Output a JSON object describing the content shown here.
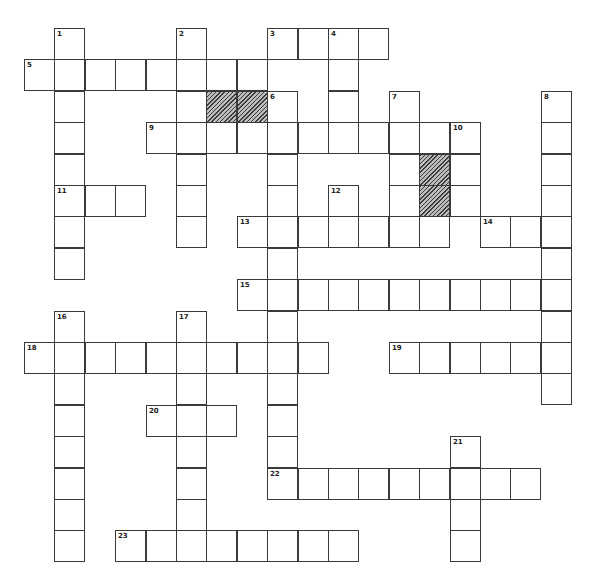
{
  "puzzle": {
    "grid": {
      "origin_x": 24,
      "origin_y": 28,
      "cell_w": 30.4,
      "cell_h": 31.4
    },
    "entries": [
      {
        "number": "1",
        "direction": "down",
        "col": 1,
        "row": 0,
        "length": 8
      },
      {
        "number": "2",
        "direction": "down",
        "col": 5,
        "row": 0,
        "length": 7
      },
      {
        "number": "3",
        "direction": "across",
        "col": 8,
        "row": 0,
        "length": 4
      },
      {
        "number": "4",
        "direction": "down",
        "col": 10,
        "row": 0,
        "length": 4
      },
      {
        "number": "5",
        "direction": "across",
        "col": 0,
        "row": 1,
        "length": 8
      },
      {
        "number": "6",
        "direction": "down",
        "col": 8,
        "row": 2,
        "length": 12
      },
      {
        "number": "7",
        "direction": "down",
        "col": 12,
        "row": 2,
        "length": 4
      },
      {
        "number": "8",
        "direction": "down",
        "col": 17,
        "row": 2,
        "length": 10
      },
      {
        "number": "9",
        "direction": "across",
        "col": 4,
        "row": 3,
        "length": 11
      },
      {
        "number": "10",
        "direction": "down",
        "col": 14,
        "row": 3,
        "length": 3
      },
      {
        "number": "11",
        "direction": "across",
        "col": 1,
        "row": 5,
        "length": 3
      },
      {
        "number": "12",
        "direction": "down",
        "col": 10,
        "row": 5,
        "length": 2
      },
      {
        "number": "13",
        "direction": "across",
        "col": 7,
        "row": 6,
        "length": 7
      },
      {
        "number": "14",
        "direction": "across",
        "col": 15,
        "row": 6,
        "length": 3
      },
      {
        "number": "15",
        "direction": "across",
        "col": 7,
        "row": 8,
        "length": 11
      },
      {
        "number": "16",
        "direction": "down",
        "col": 1,
        "row": 9,
        "length": 8
      },
      {
        "number": "17",
        "direction": "down",
        "col": 5,
        "row": 9,
        "length": 8
      },
      {
        "number": "18",
        "direction": "across",
        "col": 0,
        "row": 10,
        "length": 10
      },
      {
        "number": "19",
        "direction": "across",
        "col": 12,
        "row": 10,
        "length": 6
      },
      {
        "number": "20",
        "direction": "across",
        "col": 4,
        "row": 12,
        "length": 3
      },
      {
        "number": "21",
        "direction": "down",
        "col": 14,
        "row": 13,
        "length": 4
      },
      {
        "number": "22",
        "direction": "across",
        "col": 8,
        "row": 14,
        "length": 9
      },
      {
        "number": "23",
        "direction": "across",
        "col": 3,
        "row": 16,
        "length": 8
      }
    ],
    "shaded_cells": [
      {
        "col": 6,
        "row": 2
      },
      {
        "col": 7,
        "row": 2
      },
      {
        "col": 13,
        "row": 4
      },
      {
        "col": 13,
        "row": 5
      }
    ]
  }
}
